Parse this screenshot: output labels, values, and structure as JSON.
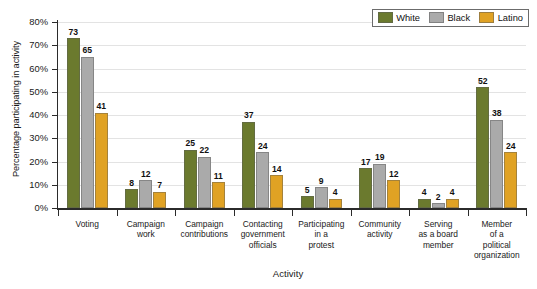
{
  "chart_data": {
    "type": "bar",
    "title": "",
    "xlabel": "Activity",
    "ylabel": "Percentage participating in activity",
    "ylim": [
      0,
      80
    ],
    "ytick_labels": [
      "0%",
      "10%",
      "20%",
      "30%",
      "40%",
      "50%",
      "60%",
      "70%",
      "80%"
    ],
    "ytick_values": [
      0,
      10,
      20,
      30,
      40,
      50,
      60,
      70,
      80
    ],
    "grid": true,
    "legend_position": "top-right",
    "categories": [
      "Voting",
      "Campaign work",
      "Campaign contributions",
      "Contacting government officials",
      "Participating in a protest",
      "Community activity",
      "Serving as a board member",
      "Member of a political organization"
    ],
    "category_label_lines": [
      [
        "Voting"
      ],
      [
        "Campaign",
        "work"
      ],
      [
        "Campaign",
        "contributions"
      ],
      [
        "Contacting",
        "government",
        "officials"
      ],
      [
        "Participating",
        "in a",
        "protest"
      ],
      [
        "Community",
        "activity"
      ],
      [
        "Serving",
        "as a board",
        "member"
      ],
      [
        "Member",
        "of a",
        "political",
        "organization"
      ]
    ],
    "series": [
      {
        "name": "White",
        "color": "#6B7A2E",
        "values": [
          73,
          8,
          25,
          37,
          5,
          17,
          4,
          52
        ]
      },
      {
        "name": "Black",
        "color": "#AAAAAA",
        "values": [
          65,
          12,
          22,
          24,
          9,
          19,
          2,
          38
        ]
      },
      {
        "name": "Latino",
        "color": "#E0A224",
        "values": [
          41,
          7,
          11,
          14,
          4,
          12,
          4,
          24
        ]
      }
    ]
  }
}
